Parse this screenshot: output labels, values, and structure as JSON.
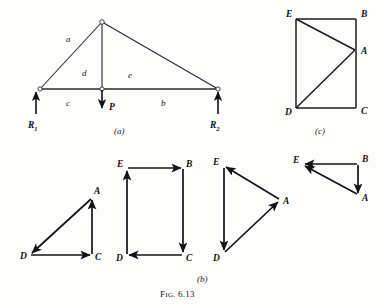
{
  "figure": {
    "caption_prefix": "F",
    "caption_smallcaps": "IG.",
    "caption_number": "6.13",
    "ink_color": "#1d1d1d",
    "background_color": "#fdfdfc"
  },
  "panel_a": {
    "label": "(a)",
    "member_labels": {
      "a": "a",
      "b": "b",
      "c": "c",
      "d": "d",
      "e": "e"
    },
    "reactions": [
      {
        "name": "R",
        "subscript": "1",
        "direction": "up"
      },
      {
        "name": "R",
        "subscript": "2",
        "direction": "up"
      }
    ],
    "load": {
      "name": "P",
      "direction": "down"
    },
    "geometry": {
      "left_support": [
        40,
        89
      ],
      "apex": [
        102,
        22
      ],
      "right_support": [
        218,
        89
      ],
      "center_joint": [
        102,
        89
      ]
    }
  },
  "panel_b": {
    "label": "(b)",
    "diagrams": [
      {
        "name": "joint-D-polygon",
        "vertices": [
          {
            "id": "D",
            "x": 30,
            "y": 255
          },
          {
            "id": "C",
            "x": 92,
            "y": 255
          },
          {
            "id": "A",
            "x": 92,
            "y": 197
          }
        ],
        "arrows": [
          "D->C",
          "C->A",
          "A->D"
        ]
      },
      {
        "name": "joint-E-rectangle-polygon",
        "vertices": [
          {
            "id": "E",
            "x": 127,
            "y": 168
          },
          {
            "id": "B",
            "x": 183,
            "y": 168
          },
          {
            "id": "C",
            "x": 183,
            "y": 255
          },
          {
            "id": "D",
            "x": 127,
            "y": 255
          }
        ],
        "arrows": [
          "E->B",
          "B->C",
          "C->D",
          "D->E"
        ]
      },
      {
        "name": "joint-A-polygon",
        "vertices": [
          {
            "id": "E",
            "x": 224,
            "y": 166
          },
          {
            "id": "D",
            "x": 224,
            "y": 253
          },
          {
            "id": "A",
            "x": 280,
            "y": 200
          }
        ],
        "arrows": [
          "E->D",
          "D->A",
          "A->E"
        ]
      },
      {
        "name": "joint-B-polygon",
        "vertices": [
          {
            "id": "E",
            "x": 303,
            "y": 164
          },
          {
            "id": "B",
            "x": 358,
            "y": 164
          },
          {
            "id": "A",
            "x": 358,
            "y": 196
          }
        ],
        "arrows": [
          "B->E",
          "B->A",
          "A->E"
        ]
      }
    ]
  },
  "panel_c": {
    "label": "(c)",
    "name": "composite-force-polygon",
    "vertices": [
      {
        "id": "E",
        "x": 296,
        "y": 19
      },
      {
        "id": "B",
        "x": 356,
        "y": 19
      },
      {
        "id": "A",
        "x": 356,
        "y": 50
      },
      {
        "id": "C",
        "x": 356,
        "y": 108
      },
      {
        "id": "D",
        "x": 296,
        "y": 108
      }
    ],
    "edges": [
      "E-B",
      "B-C",
      "C-D",
      "D-E",
      "E-A",
      "A-D"
    ]
  }
}
